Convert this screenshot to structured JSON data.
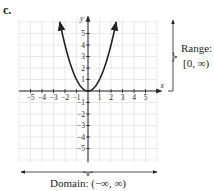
{
  "part_label": "c.",
  "axes": {
    "x_label": "x",
    "y_label": "y",
    "x_ticks": [
      "-5",
      "-4",
      "-3",
      "-2",
      "-1",
      "1",
      "2",
      "3",
      "4",
      "5"
    ],
    "y_ticks": [
      "5",
      "4",
      "3",
      "2",
      "1",
      "-1",
      "-2",
      "-3",
      "-4",
      "-5"
    ]
  },
  "range": {
    "title": "Range:",
    "value": "[0, ∞)"
  },
  "domain": {
    "text": "Domain: (−∞, ∞)"
  },
  "colors": {
    "curve": "#231f20",
    "grid": "#d9d9d9",
    "axis": "#231f20"
  },
  "chart_data": {
    "type": "line",
    "title": "",
    "function": "y = x^2",
    "xlabel": "x",
    "ylabel": "y",
    "xlim": [
      -6,
      6
    ],
    "ylim": [
      -6,
      6
    ],
    "grid": true,
    "x": [
      -2.4,
      -2,
      -1.5,
      -1,
      -0.5,
      0,
      0.5,
      1,
      1.5,
      2,
      2.4
    ],
    "y": [
      5.76,
      4,
      2.25,
      1,
      0.25,
      0,
      0.25,
      1,
      2.25,
      4,
      5.76
    ],
    "annotations": [
      "Range: [0, ∞)",
      "Domain: (−∞, ∞)"
    ]
  }
}
